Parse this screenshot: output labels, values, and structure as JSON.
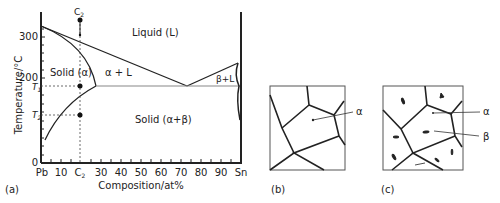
{
  "figure": {
    "panel_a": {
      "label": "(a)",
      "y_axis_label": "Temperature/°C",
      "x_axis_label": "Composition/at%",
      "y_ticks": [
        "0",
        "200",
        "300"
      ],
      "y_markers": {
        "T1": "T",
        "T1_sub": "1",
        "T2": "T",
        "T2_sub": "2"
      },
      "x_ticks": [
        "Pb",
        "10",
        "C",
        "30",
        "40",
        "50",
        "60",
        "70",
        "80",
        "90",
        "Sn"
      ],
      "x_c2_sub": "2",
      "composition_marker": {
        "label": "C",
        "sub": "2"
      },
      "regions": {
        "liquid": "Liquid (L)",
        "solid_alpha": "Solid (α)",
        "alpha_liquid": "α + L",
        "beta_liquid": "β+L",
        "solid_alpha_beta": "Solid (α+β)"
      }
    },
    "panel_b": {
      "label": "(b)",
      "phase_label": "α"
    },
    "panel_c": {
      "label": "(c)",
      "phase_labels": [
        "α",
        "β"
      ]
    }
  },
  "colors": {
    "line": "#222222",
    "grid_dash": "#444444",
    "eutectic": "#888888"
  }
}
